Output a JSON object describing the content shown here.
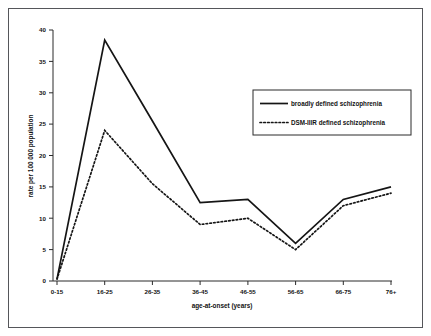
{
  "chart_data": {
    "type": "line",
    "title": "",
    "subtitle": "",
    "xlabel": "age-at-onset (years)",
    "ylabel": "rate per 100 000 population",
    "categories": [
      "0-15",
      "16-25",
      "26-35",
      "36-45",
      "46-55",
      "56-65",
      "66-75",
      "76+"
    ],
    "series": [
      {
        "name": "broadly defined schizophrenia",
        "style": "solid",
        "values": [
          0.3,
          38.4,
          25.5,
          12.5,
          13.0,
          6.0,
          13.0,
          15.0
        ]
      },
      {
        "name": "DSM-IIIR defined schizophrenia",
        "style": "dotted",
        "values": [
          0.3,
          24.0,
          15.5,
          9.0,
          10.0,
          5.0,
          12.0,
          14.0
        ]
      }
    ],
    "ylim": [
      0,
      40
    ],
    "yticks": [
      0,
      5,
      10,
      15,
      20,
      25,
      30,
      35,
      40
    ],
    "ytick_labels": [
      "0",
      "5",
      "10",
      "15",
      "20",
      "25",
      "30",
      "35",
      "40"
    ],
    "grid": false,
    "legend_position": "upper-right-inside"
  },
  "axes": {
    "y_title": "rate per 100 000 population",
    "x_title": "age-at-onset (years)"
  },
  "legend": {
    "items": [
      {
        "label": "broadly defined schizophrenia",
        "style": "solid"
      },
      {
        "label": "DSM-IIIR defined schizophrenia",
        "style": "dotted"
      }
    ]
  },
  "ticks": {
    "y": [
      "0",
      "5",
      "10",
      "15",
      "20",
      "25",
      "30",
      "35",
      "40"
    ],
    "x": [
      "0-15",
      "16-25",
      "26-35",
      "36-45",
      "46-55",
      "56-65",
      "66-75",
      "76+"
    ]
  },
  "colors": {
    "line": "#151515",
    "axis": "#2b2b2b",
    "frame": "#55565a",
    "background": "#ffffff"
  }
}
